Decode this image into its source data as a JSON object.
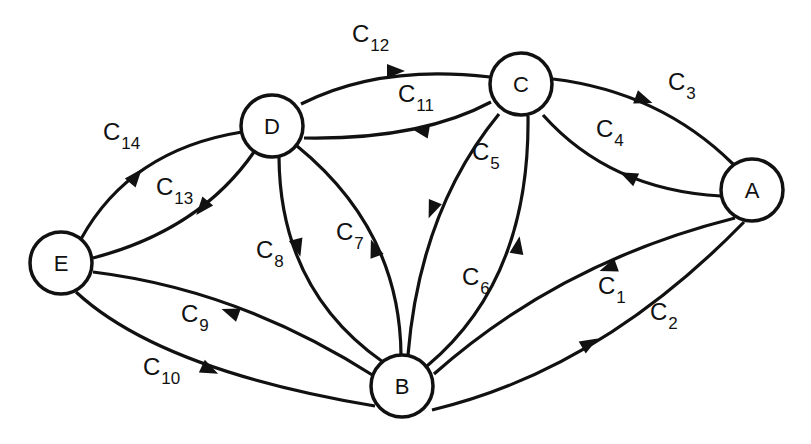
{
  "diagram": {
    "type": "directed-graph",
    "nodes": [
      {
        "id": "A",
        "label": "A",
        "x": 752,
        "y": 190,
        "r": 31
      },
      {
        "id": "B",
        "label": "B",
        "x": 402,
        "y": 386,
        "r": 31
      },
      {
        "id": "C",
        "label": "C",
        "x": 521,
        "y": 84,
        "r": 31
      },
      {
        "id": "D",
        "label": "D",
        "x": 272,
        "y": 126,
        "r": 31
      },
      {
        "id": "E",
        "label": "E",
        "x": 61,
        "y": 263,
        "r": 31
      }
    ],
    "edges": [
      {
        "id": "c1",
        "label": "C",
        "sub": "1",
        "from": "A",
        "to": "B",
        "path": "M 735 218 Q 560 262 434 374",
        "arrow": {
          "x": 608,
          "y": 268,
          "angle": 160
        },
        "label_pos": {
          "x": 598,
          "y": 294
        }
      },
      {
        "id": "c2",
        "label": "C",
        "sub": "2",
        "from": "B",
        "to": "A",
        "path": "M 432 410 Q 600 370 744 222",
        "arrow": {
          "x": 590,
          "y": 343,
          "angle": -30
        },
        "label_pos": {
          "x": 650,
          "y": 320
        }
      },
      {
        "id": "c3",
        "label": "C",
        "sub": "3",
        "from": "C",
        "to": "A",
        "path": "M 553 79 Q 660 92 733 164",
        "arrow": {
          "x": 644,
          "y": 100,
          "angle": 20
        },
        "label_pos": {
          "x": 668,
          "y": 90
        }
      },
      {
        "id": "c4",
        "label": "C",
        "sub": "4",
        "from": "A",
        "to": "C",
        "path": "M 721 196 Q 610 190 543 115",
        "arrow": {
          "x": 628,
          "y": 176,
          "angle": 205
        },
        "label_pos": {
          "x": 596,
          "y": 137
        }
      },
      {
        "id": "c5",
        "label": "C",
        "sub": "5",
        "from": "C",
        "to": "B",
        "path": "M 499 114 Q 420 210 408 355",
        "arrow": {
          "x": 432,
          "y": 210,
          "angle": 112
        },
        "label_pos": {
          "x": 472,
          "y": 160
        }
      },
      {
        "id": "c6",
        "label": "C",
        "sub": "6",
        "from": "B",
        "to": "C",
        "path": "M 427 366 Q 530 280 528 116",
        "arrow": {
          "x": 518,
          "y": 245,
          "angle": -80
        },
        "label_pos": {
          "x": 462,
          "y": 285
        }
      },
      {
        "id": "c7",
        "label": "C",
        "sub": "7",
        "from": "B",
        "to": "D",
        "path": "M 401 355 Q 400 230 297 146",
        "arrow": {
          "x": 374,
          "y": 248,
          "angle": -110
        },
        "label_pos": {
          "x": 336,
          "y": 240
        }
      },
      {
        "id": "c8",
        "label": "C",
        "sub": "8",
        "from": "D",
        "to": "B",
        "path": "M 279 157 Q 280 290 383 362",
        "arrow": {
          "x": 298,
          "y": 248,
          "angle": 75
        },
        "label_pos": {
          "x": 256,
          "y": 258
        }
      },
      {
        "id": "c9",
        "label": "C",
        "sub": "9",
        "from": "B",
        "to": "E",
        "path": "M 374 376 Q 240 290 93 272",
        "arrow": {
          "x": 230,
          "y": 312,
          "angle": 200
        },
        "label_pos": {
          "x": 181,
          "y": 322
        }
      },
      {
        "id": "c10",
        "label": "C",
        "sub": "10",
        "from": "E",
        "to": "B",
        "path": "M 76 292 Q 160 370 375 406",
        "arrow": {
          "x": 210,
          "y": 370,
          "angle": 25
        },
        "label_pos": {
          "x": 143,
          "y": 375
        }
      },
      {
        "id": "c11",
        "label": "C",
        "sub": "11",
        "from": "C",
        "to": "D",
        "path": "M 491 102 Q 420 140 304 138",
        "arrow": {
          "x": 420,
          "y": 130,
          "angle": 190
        },
        "label_pos": {
          "x": 398,
          "y": 102
        }
      },
      {
        "id": "c12",
        "label": "C",
        "sub": "12",
        "from": "D",
        "to": "C",
        "path": "M 301 104 Q 380 64 490 77",
        "arrow": {
          "x": 396,
          "y": 71,
          "angle": 0
        },
        "label_pos": {
          "x": 352,
          "y": 42
        }
      },
      {
        "id": "c13",
        "label": "C",
        "sub": "13",
        "from": "D",
        "to": "E",
        "path": "M 254 152 Q 200 230 93 258",
        "arrow": {
          "x": 202,
          "y": 208,
          "angle": 130
        },
        "label_pos": {
          "x": 156,
          "y": 195
        }
      },
      {
        "id": "c14",
        "label": "C",
        "sub": "14",
        "from": "E",
        "to": "D",
        "path": "M 81 239 Q 130 150 242 132",
        "arrow": {
          "x": 136,
          "y": 176,
          "angle": -50
        },
        "label_pos": {
          "x": 103,
          "y": 140
        }
      }
    ],
    "colors": {
      "stroke": "#111111",
      "background": "#ffffff",
      "node_fill": "#ffffff"
    }
  }
}
